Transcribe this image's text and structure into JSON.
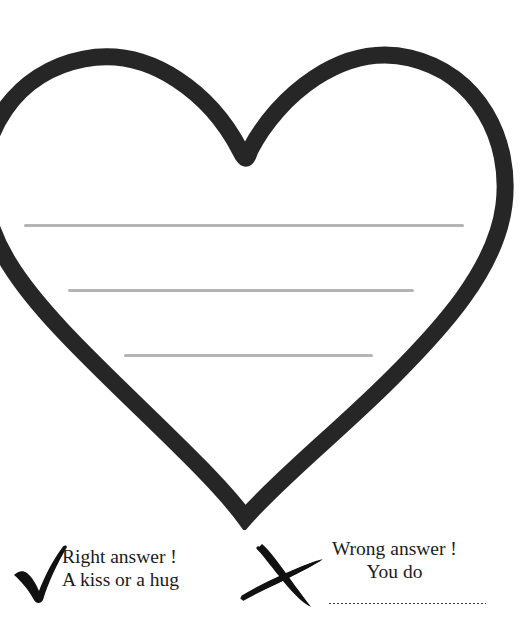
{
  "page": {
    "background_color": "#ffffff",
    "width": 526,
    "height": 638
  },
  "heart": {
    "name": "heart-outline",
    "stroke_color": "#262626",
    "fill_color": "#ffffff",
    "stroke_width": 17,
    "description": "large open heart outline, left lobe cropped by page edge",
    "writing_lines": [
      {
        "label": "writing-line-1",
        "color": "#b4b4b4"
      },
      {
        "label": "writing-line-2",
        "color": "#b4b4b4"
      },
      {
        "label": "writing-line-3",
        "color": "#b4b4b4"
      }
    ]
  },
  "answers": {
    "right": {
      "icon": "check-mark-icon",
      "icon_color": "#111111",
      "line1": "Right answer !",
      "line2": "A kiss or a hug"
    },
    "wrong": {
      "icon": "cross-mark-icon",
      "icon_color": "#111111",
      "line1": "Wrong answer !",
      "line2": "You do",
      "blank_line": "dotted-blank"
    }
  }
}
